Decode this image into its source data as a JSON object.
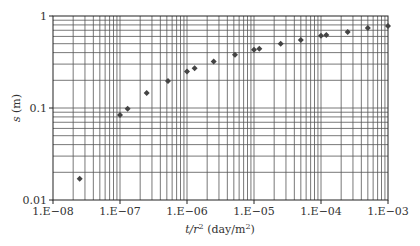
{
  "chart_data": {
    "type": "scatter",
    "title": "",
    "xlabel": "t/r² (day/m²)",
    "ylabel": "s (m)",
    "xscale": "log",
    "yscale": "log",
    "xlim": [
      1e-08,
      0.001
    ],
    "ylim": [
      0.01,
      1
    ],
    "grid": true,
    "legend": null,
    "x_tick_labels": [
      "1.E−08",
      "1.E−07",
      "1.E−06",
      "1.E−05",
      "1.E−04",
      "1.E−03"
    ],
    "y_tick_labels": [
      "0.01",
      "0.1",
      "1"
    ],
    "marker": "diamond",
    "marker_color": "#444444",
    "series": [
      {
        "name": "observed drawdown",
        "x": [
          2.5e-08,
          1e-07,
          1.3e-07,
          2.5e-07,
          5.2e-07,
          1e-06,
          1.3e-06,
          2.5e-06,
          5.2e-06,
          1e-05,
          1.2e-05,
          2.5e-05,
          5e-05,
          0.0001,
          0.00012,
          0.00025,
          0.0005,
          0.001
        ],
        "y": [
          0.017,
          0.084,
          0.098,
          0.146,
          0.196,
          0.25,
          0.27,
          0.32,
          0.38,
          0.43,
          0.44,
          0.5,
          0.55,
          0.61,
          0.62,
          0.67,
          0.74,
          0.78
        ]
      }
    ]
  },
  "axes": {
    "x_label_italic": "t/r",
    "x_label_sup": "2",
    "x_label_units": " (day/m",
    "x_label_units_sup": "2",
    "x_label_close": ")",
    "y_label_italic": "s",
    "y_label_units": " (m)"
  }
}
